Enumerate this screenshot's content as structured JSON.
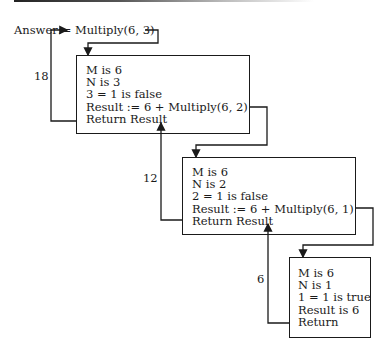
{
  "diagram": {
    "call_label": "Answer:= Multiply(6, 3)",
    "frames": [
      {
        "lines": [
          "M is 6",
          "N is 3",
          "3 = 1 is false",
          "Result := 6 + Multiply(6, 2)",
          "Return Result"
        ],
        "return_value": "18"
      },
      {
        "lines": [
          "M is 6",
          "N is 2",
          "2 = 1 is false",
          "Result := 6 + Multiply(6, 1)",
          "Return Result"
        ],
        "return_value": "12"
      },
      {
        "lines": [
          "M is 6",
          "N is 1",
          "1 = 1 is true",
          "Result is 6",
          "Return"
        ],
        "return_value": "6"
      }
    ],
    "colors": {
      "line": "#1a1a1a",
      "background": "#ffffff"
    }
  }
}
